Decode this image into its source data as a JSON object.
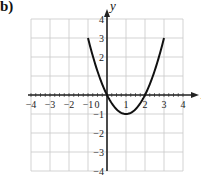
{
  "figure_label": "b)",
  "chart_data": {
    "type": "line",
    "title": "",
    "xlabel": "x",
    "ylabel": "y",
    "xlim": [
      -4,
      4
    ],
    "ylim": [
      -4,
      4
    ],
    "grid": true,
    "x_ticks": [
      "−4",
      "−3",
      "−2",
      "−1",
      "0",
      "1",
      "2",
      "3",
      "4"
    ],
    "y_ticks": [
      "4",
      "3",
      "2",
      "−1",
      "−2",
      "−3",
      "−4"
    ],
    "series": [
      {
        "name": "y = x^2 - 2x",
        "x": [
          -1,
          -0.5,
          0,
          0.5,
          1,
          1.5,
          2,
          2.5,
          3
        ],
        "y": [
          3,
          1.25,
          0,
          -0.75,
          -1,
          -0.75,
          0,
          1.25,
          3
        ]
      }
    ],
    "colors": {
      "curve": "#111111",
      "grid": "#c8c8c8",
      "axes": "#222222"
    }
  }
}
